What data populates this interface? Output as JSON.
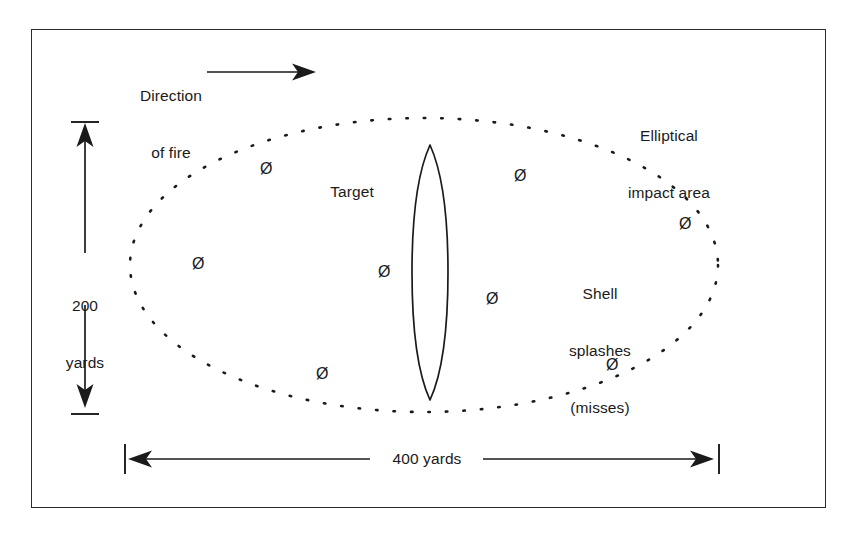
{
  "figure": {
    "title_present": false,
    "background": "#ffffff",
    "ink_color": "#1a1a1a",
    "border_color": "#2b2b2b"
  },
  "labels": {
    "direction_of_fire": {
      "line1": "Direction",
      "line2": "of fire"
    },
    "elliptical_impact_area": {
      "line1": "Elliptical",
      "line2": "impact area"
    },
    "target": "Target",
    "shell_splashes": {
      "line1": "Shell",
      "line2": "splashes",
      "line3": "(misses)"
    },
    "vertical_dimension": {
      "line1": "200",
      "line2": "yards"
    },
    "horizontal_dimension": "400 yards"
  },
  "icons": {
    "splash_marker_glyph": "Ø",
    "arrow_right_glyph": "→",
    "arrow_up_glyph": "↑",
    "arrow_down_glyph": "↓"
  },
  "chart_data": {
    "type": "diagram",
    "dimensions": {
      "width_label": "400 yards",
      "width_value": 400,
      "height_label": "200 yards",
      "height_value": 200,
      "units": "yards"
    },
    "ellipse": {
      "cx": 424,
      "cy": 265,
      "rx": 294,
      "ry": 147,
      "stroke": "dotted"
    },
    "target": {
      "label": "Target",
      "shape": "lens",
      "cx": 430,
      "cy": 272,
      "half_width": 18,
      "top_y": 145,
      "bottom_y": 400
    },
    "splashes": {
      "count": 8,
      "glyph": "Ø",
      "points": [
        {
          "x": 265,
          "y": 169
        },
        {
          "x": 519,
          "y": 176
        },
        {
          "x": 684,
          "y": 224
        },
        {
          "x": 197,
          "y": 264
        },
        {
          "x": 383,
          "y": 272
        },
        {
          "x": 491,
          "y": 299
        },
        {
          "x": 321,
          "y": 374
        },
        {
          "x": 611,
          "y": 365
        }
      ]
    },
    "annotations": [
      {
        "text": "Direction of fire",
        "x": 165,
        "y": 72,
        "arrow": "right"
      },
      {
        "text": "Elliptical impact area",
        "x": 668,
        "y": 110
      },
      {
        "text": "Shell splashes (misses)",
        "x": 600,
        "y": 285
      }
    ],
    "grid": false,
    "legend": false
  }
}
